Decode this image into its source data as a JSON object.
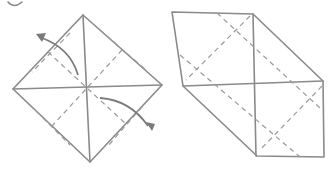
{
  "diagram": {
    "step_marker": "circle (partially cropped)",
    "figures": [
      {
        "name": "before",
        "shape": "square diamond with center creases and two fold arrows"
      },
      {
        "name": "after",
        "shape": "folded form with two opposite corner flaps folded"
      }
    ],
    "colors": {
      "line": "#8a8a8a",
      "background": "#ffffff"
    }
  }
}
